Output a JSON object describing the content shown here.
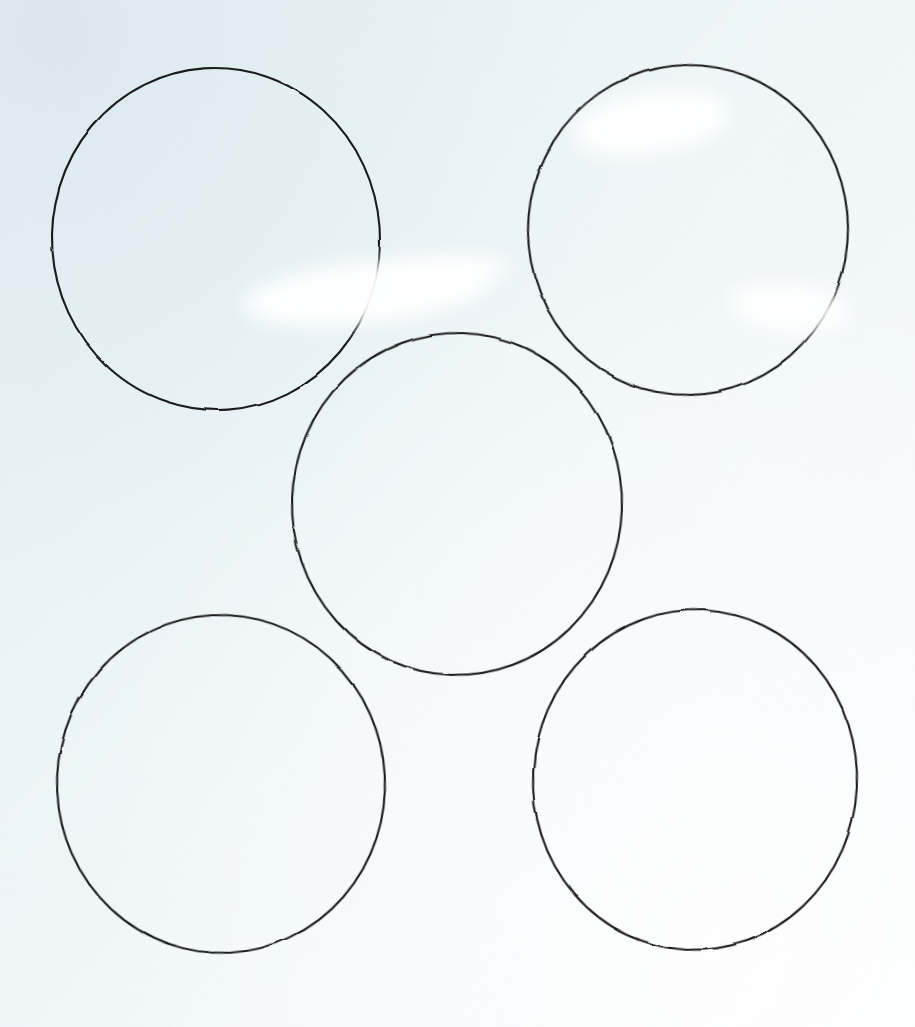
{
  "image": {
    "title": "Five hand-drawn circles on pale blue paper",
    "width": 915,
    "height": 1027,
    "medium": "pencil line drawing on paper (scanned)",
    "arrangement": "quincunx (dice-five): four corner circles plus one centered"
  },
  "colors": {
    "paper_light": "#fbfdfe",
    "paper_mid": "#eef5f8",
    "paper_tint": "#e4eff3",
    "paper_corner_shadow": "#dfeaef",
    "stroke": "#1b1b1d",
    "glare": "#ffffff"
  },
  "background": {
    "type": "diagonal-gradient",
    "from": "#e4eff3",
    "to": "#fbfdfe",
    "direction": "top-left to bottom-right"
  },
  "stroke": {
    "color": "#1b1b1d",
    "width_px": 2.1,
    "style": "hand-drawn continuous pencil line",
    "linecap": "round"
  },
  "shapes": [
    {
      "id": "circle-top-left",
      "label": "Top-left circle",
      "position": "top-left",
      "center_x": 216,
      "center_y": 239,
      "radius_x": 164,
      "radius_y": 171,
      "bbox": [
        53,
        68,
        327,
        342
      ],
      "rotation_deg": -4
    },
    {
      "id": "circle-top-right",
      "label": "Top-right circle",
      "position": "top-right",
      "center_x": 688,
      "center_y": 230,
      "radius_x": 160,
      "radius_y": 165,
      "bbox": [
        528,
        65,
        320,
        330
      ],
      "rotation_deg": 5
    },
    {
      "id": "circle-center",
      "label": "Center circle",
      "position": "center",
      "center_x": 457,
      "center_y": 504,
      "radius_x": 165,
      "radius_y": 171,
      "bbox": [
        292,
        333,
        331,
        342
      ],
      "rotation_deg": 2
    },
    {
      "id": "circle-bottom-left",
      "label": "Bottom-left circle",
      "position": "bottom-left",
      "center_x": 221,
      "center_y": 784,
      "radius_x": 164,
      "radius_y": 169,
      "bbox": [
        57,
        615,
        328,
        338
      ],
      "rotation_deg": -3
    },
    {
      "id": "circle-bottom-right",
      "label": "Bottom-right circle",
      "position": "bottom-right",
      "center_x": 695,
      "center_y": 780,
      "radius_x": 162,
      "radius_y": 170,
      "bbox": [
        533,
        610,
        325,
        340
      ],
      "rotation_deg": 3
    }
  ],
  "glare_spots": [
    {
      "id": "glare-top-left-circle",
      "label": "Paper glare inside lower-right of top-left circle",
      "left": 243,
      "top": 262,
      "width": 245,
      "height": 62,
      "opacity": 0.95,
      "rotation_deg": -6
    },
    {
      "id": "glare-top-left-circle-tail",
      "label": "Glare tail trailing right of top-left circle",
      "left": 392,
      "top": 256,
      "width": 118,
      "height": 36,
      "opacity": 0.8,
      "rotation_deg": -8
    },
    {
      "id": "glare-top-right-upper",
      "label": "Paper glare at upper-left inside top-right circle",
      "left": 573,
      "top": 92,
      "width": 158,
      "height": 62,
      "opacity": 0.95,
      "rotation_deg": -9
    },
    {
      "id": "glare-top-right-lower",
      "label": "Paper glare at lower-right inside top-right circle",
      "left": 730,
      "top": 283,
      "width": 122,
      "height": 50,
      "opacity": 0.85,
      "rotation_deg": 6
    }
  ]
}
